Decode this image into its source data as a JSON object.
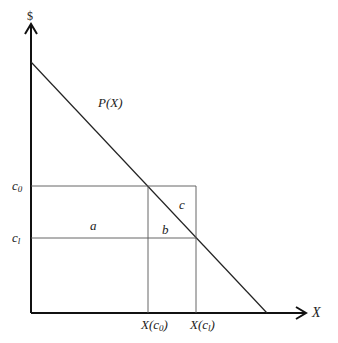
{
  "diagram": {
    "y_axis_label": "$",
    "x_axis_label": "X",
    "curve_label": "P(X)",
    "levels": [
      {
        "name": "c0",
        "base": "c",
        "sub": "0",
        "x_tick_label_base": "X(c",
        "x_tick_label_sub": "0",
        "x_tick_label_end": ")"
      },
      {
        "name": "c1",
        "base": "c",
        "sub": "l",
        "x_tick_label_base": "X(c",
        "x_tick_label_sub": "l",
        "x_tick_label_end": ")"
      }
    ],
    "regions": {
      "a": "a",
      "b": "b",
      "c": "c"
    },
    "colors": {
      "axis": "#111111",
      "line": "#222222",
      "guide": "#555555"
    }
  }
}
